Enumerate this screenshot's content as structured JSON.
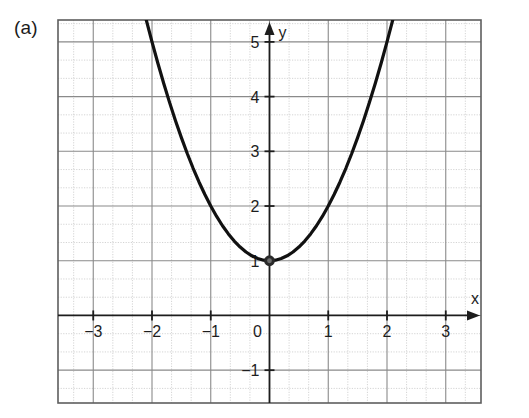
{
  "figure": {
    "panel_label": "(a)",
    "background_color": "#ffffff"
  },
  "chart_data": {
    "type": "line",
    "title": "",
    "subtitle": "",
    "xlabel": "x",
    "ylabel": "y",
    "function": "y = x^2 + 1",
    "xlim": [
      -3.6,
      3.6
    ],
    "ylim": [
      -1.6,
      5.4
    ],
    "xticks": [
      -3,
      -2,
      -1,
      0,
      1,
      2,
      3
    ],
    "xtick_labels": [
      "−3",
      "−2",
      "−1",
      "0",
      "1",
      "2",
      "3"
    ],
    "yticks": [
      -1,
      1,
      2,
      3,
      4,
      5
    ],
    "ytick_labels": [
      "−1",
      "1",
      "2",
      "3",
      "4",
      "5"
    ],
    "grid": true,
    "grid_major_step": 1,
    "grid_minor_subdivisions": 3,
    "grid_major_color": "#8a8a8a",
    "grid_minor_color": "#c9c9c9",
    "axis_color": "#1d1d1d",
    "curve_color": "#111111",
    "curve_width": 3.2,
    "legend": null,
    "legend_position": "none",
    "series": [
      {
        "name": "y = x^2 + 1",
        "x": [
          -2.1,
          -2.0,
          -1.9,
          -1.8,
          -1.7,
          -1.6,
          -1.5,
          -1.4,
          -1.3,
          -1.2,
          -1.1,
          -1.0,
          -0.9,
          -0.8,
          -0.7,
          -0.6,
          -0.5,
          -0.4,
          -0.3,
          -0.2,
          -0.1,
          0.0,
          0.1,
          0.2,
          0.3,
          0.4,
          0.5,
          0.6,
          0.7,
          0.8,
          0.9,
          1.0,
          1.1,
          1.2,
          1.3,
          1.4,
          1.5,
          1.6,
          1.7,
          1.8,
          1.9,
          2.0,
          2.1
        ],
        "y": [
          5.41,
          5.0,
          4.61,
          4.24,
          3.89,
          3.56,
          3.25,
          2.96,
          2.69,
          2.44,
          2.21,
          2.0,
          1.81,
          1.64,
          1.49,
          1.36,
          1.25,
          1.16,
          1.09,
          1.04,
          1.01,
          1.0,
          1.01,
          1.04,
          1.09,
          1.16,
          1.25,
          1.36,
          1.49,
          1.64,
          1.81,
          2.0,
          2.21,
          2.44,
          2.69,
          2.96,
          3.25,
          3.56,
          3.89,
          4.24,
          4.61,
          5.0,
          5.41
        ]
      }
    ],
    "annotations": [
      {
        "name": "vertex-point",
        "x": 0,
        "y": 1,
        "marker": "filled-circle",
        "label": ""
      }
    ],
    "axis_arrows": {
      "x_arrow_label": "x",
      "y_arrow_label": "y"
    }
  }
}
